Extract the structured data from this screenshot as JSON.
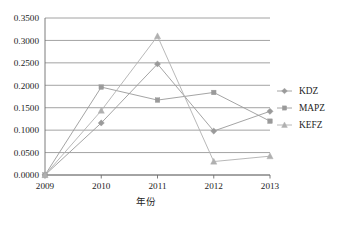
{
  "chart_data": {
    "type": "line",
    "title": "",
    "xlabel": "年份",
    "ylabel": "",
    "categories": [
      "2009",
      "2010",
      "2011",
      "2012",
      "2013"
    ],
    "series": [
      {
        "name": "KDZ",
        "marker": "diamond",
        "color": "#9a9a9a",
        "values": [
          0.0,
          0.116,
          0.2475,
          0.098,
          0.142
        ]
      },
      {
        "name": "MAPZ",
        "marker": "square",
        "color": "#9a9a9a",
        "values": [
          0.0,
          0.196,
          0.167,
          0.184,
          0.12
        ]
      },
      {
        "name": "KEFZ",
        "marker": "triangle",
        "color": "#b0b0b0",
        "values": [
          0.0,
          0.1435,
          0.3095,
          0.03,
          0.042
        ]
      }
    ],
    "ylim": [
      0.0,
      0.35
    ],
    "ytick_labels": [
      "0.0000",
      "0.0500",
      "0.1000",
      "0.1500",
      "0.2000",
      "0.2500",
      "0.3000",
      "0.3500"
    ],
    "ytick_values": [
      0.0,
      0.05,
      0.1,
      0.15,
      0.2,
      0.25,
      0.3,
      0.35
    ],
    "grid": true,
    "legend_position": "right",
    "gridline_color": "#8c8c8c",
    "axis_color": "#6e6e6e",
    "text_color": "#1d1d1d"
  },
  "legend": {
    "entries": [
      {
        "label": "KDZ"
      },
      {
        "label": "MAPZ"
      },
      {
        "label": "KEFZ"
      }
    ]
  },
  "axes": {
    "x_title": "年份"
  }
}
